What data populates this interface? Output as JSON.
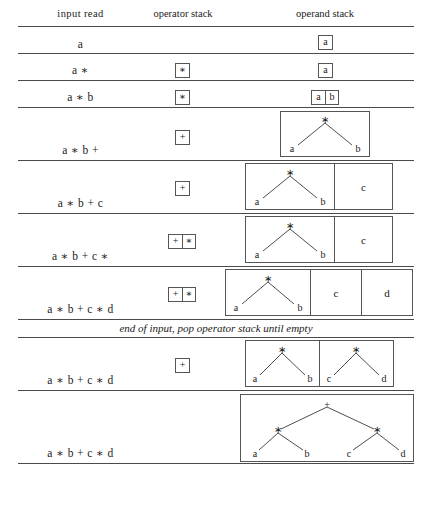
{
  "figure": {
    "type": "expression-parse-trace-table",
    "columns": [
      "input read",
      "operator stack",
      "operand stack"
    ]
  },
  "header": {
    "input_read": "input read",
    "operator_stack": "operator stack",
    "operand_stack": "operand stack"
  },
  "note": {
    "end_of_input": "end of input, pop operator stack until empty"
  },
  "rows": [
    {
      "input": "a",
      "operators": [],
      "operands": [
        "a"
      ]
    },
    {
      "input": "a ∗",
      "operators": [
        "∗"
      ],
      "operands": [
        "a"
      ]
    },
    {
      "input": "a ∗ b",
      "operators": [
        "∗"
      ],
      "operands": [
        "a",
        "b"
      ]
    },
    {
      "input": "a ∗ b +",
      "operators": [
        "+"
      ],
      "operands": [
        "tree-ab"
      ]
    },
    {
      "input": "a ∗ b + c",
      "operators": [
        "+"
      ],
      "operands": [
        "tree-ab",
        "c"
      ]
    },
    {
      "input": "a ∗ b + c ∗",
      "operators": [
        "+",
        "∗"
      ],
      "operands": [
        "tree-ab",
        "c"
      ]
    },
    {
      "input": "a ∗ b + c ∗ d",
      "operators": [
        "+",
        "∗"
      ],
      "operands": [
        "tree-ab",
        "c",
        "d"
      ]
    },
    {
      "input": "a ∗ b + c ∗ d",
      "operators": [
        "+"
      ],
      "operands": [
        "tree-ab",
        "tree-cd"
      ]
    },
    {
      "input": "a ∗ b + c ∗ d",
      "operators": [],
      "operands": [
        "tree-full"
      ]
    }
  ],
  "trees": {
    "tree_ab": {
      "root": "∗",
      "left": "a",
      "right": "b"
    },
    "tree_cd": {
      "root": "∗",
      "left": "c",
      "right": "d"
    },
    "tree_full": {
      "root": "+",
      "left": {
        "root": "∗",
        "left": "a",
        "right": "b"
      },
      "right": {
        "root": "∗",
        "left": "c",
        "right": "d"
      }
    }
  },
  "tokens": {
    "star": "∗",
    "plus": "+",
    "a": "a",
    "b": "b",
    "c": "c",
    "d": "d"
  },
  "colors": {
    "rule": "#4a4a4a",
    "box_border": "#555555",
    "text": "#1a1a1a",
    "background": "#ffffff"
  }
}
